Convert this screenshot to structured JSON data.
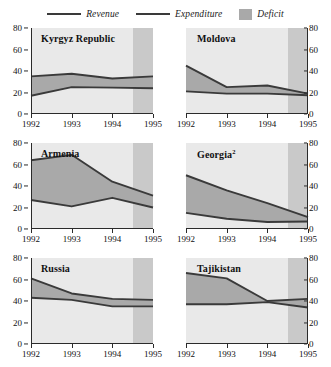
{
  "legend": {
    "items": [
      {
        "label": "Revenue",
        "marker": "line",
        "color": "#3a3a3a"
      },
      {
        "label": "Expenditure",
        "marker": "line",
        "color": "#3a3a3a"
      },
      {
        "label": "Deficit",
        "marker": "swatch",
        "color": "#a9a9a9"
      }
    ]
  },
  "colors": {
    "plot_background": "#e9e9e9",
    "projection_background": "#c9c9c9",
    "deficit_fill": "#a9a9a9",
    "line": "#3a3a3a",
    "axis": "#2b2b2b"
  },
  "axes": {
    "y_ticks": [
      0,
      20,
      40,
      60,
      80
    ],
    "y_min": 0,
    "y_max": 80,
    "x_ticks": [
      1992,
      1993,
      1994,
      1995
    ],
    "x_min": 1992,
    "x_max": 1995,
    "projection_start": 1994.5
  },
  "chart_data": [
    {
      "type": "area",
      "title": "Kyrgyz Republic",
      "footnote_marker": "",
      "panel": 0,
      "x": [
        1992,
        1993,
        1994,
        1995
      ],
      "categories": [
        "1992",
        "1993",
        "1994",
        "1995"
      ],
      "series": [
        {
          "name": "Expenditure",
          "values": [
            35,
            37.5,
            33,
            35
          ]
        },
        {
          "name": "Revenue",
          "values": [
            17,
            25,
            24.5,
            24
          ]
        }
      ],
      "xlabel": "",
      "ylabel": "",
      "ylim": [
        0,
        80
      ],
      "grid": false,
      "legend_position": "top"
    },
    {
      "type": "area",
      "title": "Moldova",
      "footnote_marker": "",
      "panel": 1,
      "x": [
        1992,
        1993,
        1994,
        1995
      ],
      "categories": [
        "1992",
        "1993",
        "1994",
        "1995"
      ],
      "series": [
        {
          "name": "Expenditure",
          "values": [
            45,
            25,
            26.5,
            19
          ]
        },
        {
          "name": "Revenue",
          "values": [
            21,
            19,
            19,
            17.5
          ]
        }
      ],
      "xlabel": "",
      "ylabel": "",
      "ylim": [
        0,
        80
      ],
      "grid": false,
      "legend_position": "top"
    },
    {
      "type": "area",
      "title": "Armenia",
      "footnote_marker": "",
      "panel": 2,
      "x": [
        1992,
        1993,
        1994,
        1995
      ],
      "categories": [
        "1992",
        "1993",
        "1994",
        "1995"
      ],
      "series": [
        {
          "name": "Expenditure",
          "values": [
            64,
            69,
            44,
            31
          ]
        },
        {
          "name": "Revenue",
          "values": [
            27,
            21,
            29,
            20
          ]
        }
      ],
      "xlabel": "",
      "ylabel": "",
      "ylim": [
        0,
        80
      ],
      "grid": false,
      "legend_position": "top"
    },
    {
      "type": "area",
      "title": "Georgia",
      "footnote_marker": "2",
      "panel": 3,
      "x": [
        1992,
        1993,
        1994,
        1995
      ],
      "categories": [
        "1992",
        "1993",
        "1994",
        "1995"
      ],
      "series": [
        {
          "name": "Expenditure",
          "values": [
            50,
            36,
            24,
            11
          ]
        },
        {
          "name": "Revenue",
          "values": [
            15,
            9.5,
            6.5,
            7
          ]
        }
      ],
      "xlabel": "",
      "ylabel": "",
      "ylim": [
        0,
        80
      ],
      "grid": false,
      "legend_position": "top"
    },
    {
      "type": "area",
      "title": "Russia",
      "footnote_marker": "",
      "panel": 4,
      "x": [
        1992,
        1993,
        1994,
        1995
      ],
      "categories": [
        "1992",
        "1993",
        "1994",
        "1995"
      ],
      "series": [
        {
          "name": "Expenditure",
          "values": [
            61,
            47,
            42,
            41
          ]
        },
        {
          "name": "Revenue",
          "values": [
            43,
            41,
            35,
            35
          ]
        }
      ],
      "xlabel": "",
      "ylabel": "",
      "ylim": [
        0,
        80
      ],
      "grid": false,
      "legend_position": "top"
    },
    {
      "type": "area",
      "title": "Tajikistan",
      "footnote_marker": "",
      "panel": 5,
      "x": [
        1992,
        1993,
        1994,
        1995
      ],
      "categories": [
        "1992",
        "1993",
        "1994",
        "1995"
      ],
      "series": [
        {
          "name": "Expenditure",
          "values": [
            66,
            61,
            40,
            42
          ]
        },
        {
          "name": "Revenue",
          "values": [
            37,
            37,
            39,
            34
          ]
        }
      ],
      "xlabel": "",
      "ylabel": "",
      "ylim": [
        0,
        80
      ],
      "grid": false,
      "legend_position": "top"
    }
  ]
}
